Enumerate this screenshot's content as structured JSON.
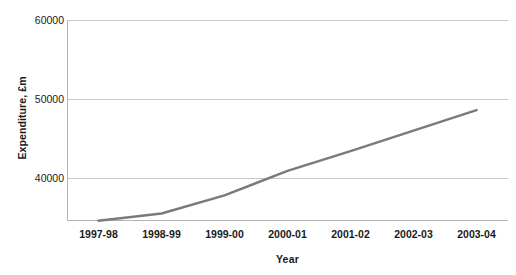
{
  "chart_data": {
    "type": "line",
    "title": "",
    "subtitle": "",
    "xlabel": "Year",
    "ylabel": "Expenditure, £m",
    "categories": [
      "1997-98",
      "1998-99",
      "1999-00",
      "2000-01",
      "2001-02",
      "2002-03",
      "2003-04"
    ],
    "series": [
      {
        "name": "Expenditure",
        "values": [
          34600,
          35500,
          37800,
          40900,
          43400,
          46000,
          48600
        ],
        "color": "#7a7a7a",
        "line_width": 2.5,
        "markers": false
      }
    ],
    "ylim": [
      34560,
      60000
    ],
    "ytick_labels": [
      "60000",
      "50000",
      "40000"
    ],
    "ytick_values": [
      60000,
      50000,
      40000
    ],
    "grid": {
      "horizontal": true,
      "vertical": false,
      "color": "#c8c8c8"
    },
    "legend": {
      "visible": false,
      "position": "none",
      "entries": []
    },
    "axes": {
      "left_spine": true,
      "bottom_spine": true,
      "top_spine": false,
      "right_spine": false,
      "spine_color": "#b4b4b4"
    },
    "annotations": [],
    "background_color": "#ffffff",
    "text_color": "#1a1a1a"
  },
  "clipped_text": ""
}
